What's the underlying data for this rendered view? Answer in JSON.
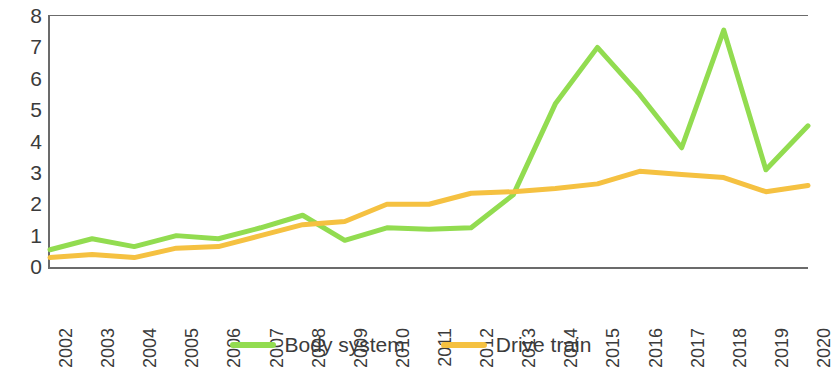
{
  "chart_data": {
    "type": "line",
    "title": "",
    "xlabel": "",
    "ylabel": "",
    "categories": [
      "2002",
      "2003",
      "2004",
      "2005",
      "2006",
      "2007",
      "2008",
      "2009",
      "2010",
      "2011",
      "2012",
      "2013",
      "2014",
      "2015",
      "2016",
      "2017",
      "2018",
      "2019",
      "2020"
    ],
    "ylim": [
      0,
      8
    ],
    "y_ticks": [
      "0",
      "1",
      "2",
      "3",
      "4",
      "5",
      "6",
      "7",
      "8"
    ],
    "grid": false,
    "legend_position": "bottom",
    "series": [
      {
        "name": "Body system",
        "color": "#92DC50",
        "values": [
          0.55,
          0.9,
          0.65,
          1.0,
          0.9,
          1.25,
          1.65,
          0.85,
          1.25,
          1.2,
          1.25,
          2.3,
          5.2,
          7.0,
          5.5,
          3.8,
          7.55,
          3.1,
          4.5
        ]
      },
      {
        "name": "Drive train",
        "color": "#F5C141",
        "values": [
          0.3,
          0.4,
          0.3,
          0.6,
          0.65,
          1.0,
          1.35,
          1.45,
          2.0,
          2.0,
          2.35,
          2.4,
          2.5,
          2.65,
          3.05,
          2.95,
          2.85,
          2.4,
          2.6
        ]
      }
    ]
  }
}
